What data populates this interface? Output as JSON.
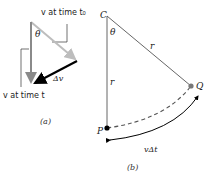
{
  "part_a": {
    "label_v_t0": "v at time t₀",
    "label_v_t": "v at time t",
    "label_theta": "θ",
    "label_delta_v": "Δv",
    "caption": "(a)",
    "colors": {
      "v_t0": "#bdbdbd",
      "v_t": "#8a8a8a",
      "delta_v": "#000000"
    }
  },
  "part_b": {
    "label_C": "C",
    "label_P": "P",
    "label_Q": "Q",
    "label_theta": "θ",
    "label_r_radial": "r",
    "label_r_vertical": "r",
    "label_arc": "vΔt",
    "caption": "(b)",
    "colors": {
      "lines": "#555555",
      "P_dot": "#000000",
      "Q_dot": "#777777"
    }
  }
}
